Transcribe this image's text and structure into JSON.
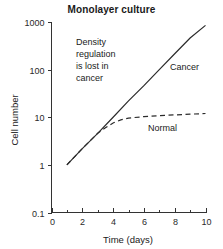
{
  "chart_data": {
    "type": "line",
    "title": "Monolayer culture",
    "xlabel": "Time (days)",
    "ylabel": "Cell number",
    "xlim": [
      0,
      10
    ],
    "ylim": [
      0.1,
      1000
    ],
    "yscale": "log",
    "grid": false,
    "legend_position": "inline-labels",
    "xticks": [
      0,
      2,
      4,
      6,
      8,
      10
    ],
    "xtick_labels": [
      "0",
      "2",
      "4",
      "6",
      "8",
      "10"
    ],
    "xminor_ticks": [
      1,
      3,
      5,
      7,
      9
    ],
    "yticks": [
      0.1,
      1,
      10,
      100,
      1000
    ],
    "ytick_labels": [
      "0.1",
      "1",
      "10",
      "100",
      "1000"
    ],
    "series": [
      {
        "name": "Cancer",
        "style": "solid",
        "x": [
          1,
          2,
          3,
          4,
          5,
          6,
          7,
          8,
          9,
          10
        ],
        "values": [
          1,
          2.2,
          4.6,
          10,
          22,
          46,
          100,
          215,
          460,
          850
        ]
      },
      {
        "name": "Normal",
        "style": "dashed",
        "x": [
          1,
          2,
          3,
          3.5,
          4,
          4.5,
          5,
          6,
          7,
          8,
          9,
          10
        ],
        "values": [
          1,
          2.2,
          4.6,
          6.0,
          7.6,
          8.8,
          9.6,
          10.3,
          10.8,
          11.2,
          11.6,
          12
        ]
      }
    ],
    "annotations": [
      {
        "name": "density-regulation-note",
        "lines": [
          "Density",
          "regulation",
          "is lost in",
          "cancer"
        ],
        "x": 2.4,
        "y": 300
      },
      {
        "name": "cancer-label",
        "text": "Cancer",
        "x": 7.6,
        "y": 130
      },
      {
        "name": "normal-label",
        "text": "Normal",
        "x": 7.0,
        "y": 5.4
      }
    ]
  },
  "colors": {
    "curve": "#2b2b2b",
    "axis": "#333333",
    "text": "#1a1a1a",
    "background": "#ffffff"
  }
}
